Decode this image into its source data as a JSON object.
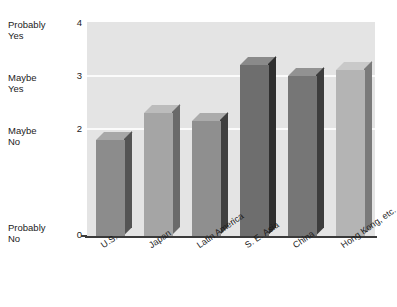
{
  "chart_data": {
    "type": "bar",
    "title": "",
    "subtitle": "",
    "xlabel": "",
    "ylabel": "",
    "categories": [
      "U.S.",
      "Japan",
      "Latin America",
      "S. E. Asia",
      "China",
      "Hong Kong, etc."
    ],
    "values": [
      1.8,
      2.3,
      2.15,
      3.2,
      3.0,
      3.1
    ],
    "series": [
      {
        "name": "",
        "values": [
          1.8,
          2.3,
          2.15,
          3.2,
          3.0,
          3.1
        ]
      }
    ],
    "ylim": [
      0,
      4
    ],
    "y_ticks": [
      0,
      2,
      3,
      4
    ],
    "y_tick_labels": [
      "0",
      "2",
      "3",
      "4"
    ],
    "y_category_labels": [
      {
        "value": 4,
        "label": "Probably\nYes"
      },
      {
        "value": 3,
        "label": "Maybe\nYes"
      },
      {
        "value": 2,
        "label": "Maybe\nNo"
      },
      {
        "value": 0,
        "label": "Probably\nNo"
      }
    ],
    "gridlines": [
      2,
      3
    ],
    "grid": true,
    "legend": "none",
    "legend_position": "none",
    "style_3d": true,
    "bar_colors": [
      "#8c8c8c",
      "#a5a5a5",
      "#8f8f8f",
      "#6e6e6e",
      "#767676",
      "#b4b4b4"
    ],
    "bar_side_colors": [
      "#545454",
      "#6a6a6a",
      "#3f3f3f",
      "#2f2f2f",
      "#3d3d3d",
      "#7a7a7a"
    ],
    "bar_top_colors": [
      "#a8a8a8",
      "#bcbcbc",
      "#ababab",
      "#8a8a8a",
      "#929292",
      "#c9c9c9"
    ],
    "plot_background": "#e4e4e4",
    "gridline_color": "#fbfbfb",
    "axis_color": "#3a3a3a",
    "text_color": "#1c1c1c"
  }
}
